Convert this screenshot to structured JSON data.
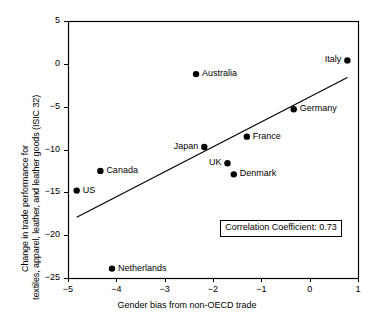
{
  "chart_data": {
    "type": "scatter",
    "title": "",
    "xlabel": "Gender bias from non-OECD trade",
    "ylabel_line1": "Change in trade performance for",
    "ylabel_line2": "textiles, apparel, leather, and leather goods (ISIC 32)",
    "xlim": [
      -5,
      1
    ],
    "ylim": [
      -25,
      5
    ],
    "xticks": [
      -5,
      -4,
      -3,
      -2,
      -1,
      0,
      1
    ],
    "xticklabels": [
      "−5",
      "−4",
      "−3",
      "−2",
      "−1",
      "0",
      "1"
    ],
    "yticks": [
      5,
      0,
      -5,
      -10,
      -15,
      -20,
      -25
    ],
    "yticklabels": [
      "5",
      "0",
      "−5",
      "−10",
      "−15",
      "−20",
      "−25"
    ],
    "grid": false,
    "legend": "none",
    "marker_color": "#000000",
    "line_color": "#000000",
    "points": [
      {
        "label": "Italy",
        "x": 0.78,
        "y": 0.4,
        "label_side": "left"
      },
      {
        "label": "Australia",
        "x": -2.35,
        "y": -1.2,
        "label_side": "right"
      },
      {
        "label": "Germany",
        "x": -0.33,
        "y": -5.3,
        "label_side": "right"
      },
      {
        "label": "France",
        "x": -1.3,
        "y": -8.5,
        "label_side": "right"
      },
      {
        "label": "Japan",
        "x": -2.18,
        "y": -9.7,
        "label_side": "left"
      },
      {
        "label": "UK",
        "x": -1.7,
        "y": -11.6,
        "label_side": "left"
      },
      {
        "label": "Canada",
        "x": -4.33,
        "y": -12.5,
        "label_side": "right"
      },
      {
        "label": "Denmark",
        "x": -1.57,
        "y": -12.9,
        "label_side": "right"
      },
      {
        "label": "US",
        "x": -4.82,
        "y": -14.8,
        "label_side": "right"
      },
      {
        "label": "Netherlands",
        "x": -4.09,
        "y": -23.9,
        "label_side": "right"
      }
    ],
    "trendline": {
      "x1": -4.82,
      "y1": -17.9,
      "x2": 0.78,
      "y2": -1.6
    },
    "annotation": {
      "text": "Correlation Coefficient: 0.73",
      "correlation_coefficient": 0.73,
      "x": -1.85,
      "y": -19.2
    }
  }
}
